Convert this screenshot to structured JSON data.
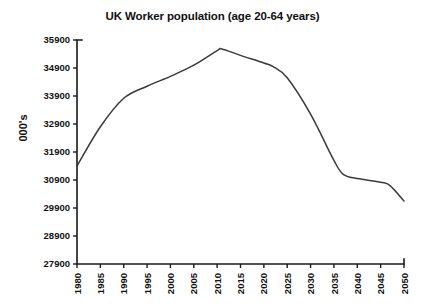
{
  "chart_data": {
    "type": "line",
    "title": "UK Worker population (age 20-64 years)",
    "xlabel": "",
    "ylabel": "000's",
    "ylim": [
      27900,
      35900
    ],
    "ytick_step": 1000,
    "xlim": [
      1980,
      2050
    ],
    "xtick_step": 5,
    "grid": false,
    "legend": null,
    "line_color": "#3a3a3a",
    "background_color": "#ffffff",
    "axis_color": "#1a1a1a",
    "ytick_labels": [
      "35900",
      "34900",
      "33900",
      "32900",
      "31900",
      "30900",
      "29900",
      "28900",
      "27900"
    ],
    "xtick_labels": [
      "1980",
      "1985",
      "1990",
      "1995",
      "2000",
      "2005",
      "2010",
      "2015",
      "2020",
      "2025",
      "2030",
      "2035",
      "2040",
      "2045",
      "2050"
    ],
    "x": [
      1980,
      1985,
      1990,
      1995,
      2000,
      2005,
      2010,
      2011,
      2015,
      2020,
      2022,
      2025,
      2030,
      2035,
      2037,
      2040,
      2045,
      2047,
      2050
    ],
    "values": [
      31400,
      32800,
      33820,
      34250,
      34600,
      35000,
      35520,
      35580,
      35350,
      35080,
      34950,
      34550,
      33250,
      31600,
      31100,
      30950,
      30820,
      30700,
      30150
    ],
    "series": [
      {
        "name": "UK Worker population (age 20-64 years)",
        "values": [
          31400,
          32800,
          33820,
          34250,
          34600,
          35000,
          35520,
          35580,
          35350,
          35080,
          34950,
          34550,
          33250,
          31600,
          31100,
          30950,
          30820,
          30700,
          30150
        ]
      }
    ],
    "peak": {
      "year": 2011,
      "value": 35580
    },
    "start": {
      "year": 1980,
      "value": 31400
    },
    "end": {
      "year": 2050,
      "value": 30150
    }
  }
}
